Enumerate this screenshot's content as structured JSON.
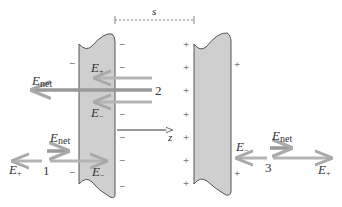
{
  "diagram": {
    "type": "parallel-plate capacitor field superposition",
    "separation_label": "s",
    "axis_label": "z",
    "colors": {
      "plate_fill": "#cfcfcf",
      "plate_stroke": "#555555",
      "field_arrow": "#a9a9a9",
      "net_arrow": "#9a9a9a",
      "text": "#333333"
    },
    "left_plate": {
      "charge_sign": "−",
      "name": "negative-plate"
    },
    "right_plate": {
      "charge_sign": "+",
      "name": "positive-plate"
    },
    "regions": [
      {
        "id": "1",
        "label": "1",
        "position": "left of negative plate",
        "fields": [
          "E+",
          "E−"
        ],
        "net": "Enet"
      },
      {
        "id": "2",
        "label": "2",
        "position": "between plates",
        "fields": [
          "E+",
          "E−"
        ],
        "net": "Enet"
      },
      {
        "id": "3",
        "label": "3",
        "position": "right of positive plate",
        "fields": [
          "E−",
          "E+"
        ],
        "net": "Enet"
      }
    ],
    "labels": {
      "E_base": "E",
      "plus_sub": "+",
      "minus_sub": "−",
      "net_sub": "net",
      "region1": "1",
      "region2": "2",
      "region3": "3",
      "s": "s",
      "z": "z"
    }
  }
}
